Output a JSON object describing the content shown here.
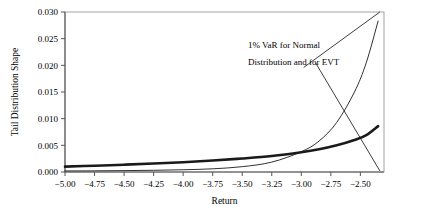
{
  "chart_data": {
    "type": "line",
    "title": "",
    "xlabel": "Return",
    "ylabel": "Tail Distribution Shape",
    "xlim": [
      -5.0,
      -2.3
    ],
    "ylim": [
      0.0,
      0.03
    ],
    "grid": false,
    "legend_position": "none",
    "xticks": [
      -5.0,
      -4.75,
      -4.5,
      -4.25,
      -4.0,
      -3.75,
      -3.5,
      -3.25,
      -3.0,
      -2.75,
      -2.5
    ],
    "xtick_labels": [
      "−5.00",
      "−4.75",
      "−4.50",
      "−4.25",
      "−4.00",
      "−3.75",
      "−3.50",
      "−3.25",
      "−3.00",
      "−2.75",
      "−2.50"
    ],
    "yticks": [
      0.0,
      0.005,
      0.01,
      0.015,
      0.02,
      0.025,
      0.03
    ],
    "ytick_labels": [
      "0.000",
      "0.005",
      "0.010",
      "0.015",
      "0.020",
      "0.025",
      "0.030"
    ],
    "series": [
      {
        "name": "EVT tail distribution",
        "style": "thick",
        "color": "#1a1a1a",
        "linewidth": 2.6,
        "x": [
          -5.0,
          -4.75,
          -4.5,
          -4.25,
          -4.0,
          -3.75,
          -3.5,
          -3.25,
          -3.0,
          -2.85,
          -2.7,
          -2.55,
          -2.45,
          -2.35
        ],
        "y": [
          0.001,
          0.00118,
          0.00137,
          0.00158,
          0.00183,
          0.00215,
          0.00253,
          0.003,
          0.0037,
          0.00425,
          0.005,
          0.006,
          0.0069,
          0.0086
        ]
      },
      {
        "name": "Normal tail distribution",
        "style": "thin",
        "color": "#1a1a1a",
        "linewidth": 0.9,
        "x": [
          -5.0,
          -4.75,
          -4.5,
          -4.25,
          -4.0,
          -3.75,
          -3.5,
          -3.25,
          -3.0,
          -2.85,
          -2.7,
          -2.55,
          -2.45,
          -2.35
        ],
        "y": [
          0.0002,
          0.00022,
          0.00026,
          0.00032,
          0.00042,
          0.0006,
          0.001,
          0.00185,
          0.0038,
          0.0058,
          0.0093,
          0.015,
          0.0205,
          0.0283
        ]
      }
    ],
    "annotations": [
      {
        "name": "var-annotation",
        "line1": "1% VaR for Normal",
        "line2": "Distribution and for EVT",
        "leaders": [
          {
            "name": "leader-to-normal",
            "x1": -2.88,
            "y1": 0.0205,
            "x2": -2.335,
            "y2": 0.0002
          },
          {
            "name": "leader-to-evt",
            "x1": -2.98,
            "y1": 0.0196,
            "x2": -2.335,
            "y2": 0.03
          }
        ]
      }
    ]
  }
}
